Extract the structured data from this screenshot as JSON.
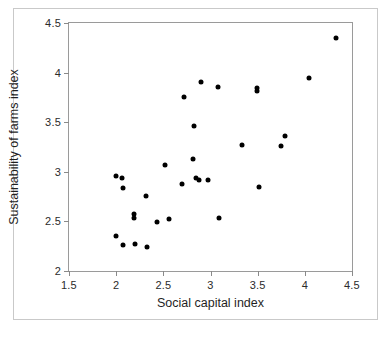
{
  "chart_data": {
    "type": "scatter",
    "title": "",
    "xlabel": "Social capital index",
    "ylabel": "Sustainability of farms index",
    "xlim": [
      1.5,
      4.5
    ],
    "ylim": [
      2,
      4.5
    ],
    "xticks": [
      "1.5",
      "2",
      "2.5",
      "3",
      "3.5",
      "4",
      "4.5"
    ],
    "xtick_values": [
      1.5,
      2,
      2.5,
      3,
      3.5,
      4,
      4.5
    ],
    "yticks": [
      "2",
      "2.5",
      "3",
      "3.5",
      "4",
      "4.5"
    ],
    "ytick_values": [
      2,
      2.5,
      3,
      3.5,
      4,
      4.5
    ],
    "grid": false,
    "legend": null,
    "marker": {
      "shape": "diamond-dot",
      "color": "#000000",
      "size": 5
    },
    "points": [
      {
        "x": 2.0,
        "y": 2.96
      },
      {
        "x": 2.0,
        "y": 2.35
      },
      {
        "x": 2.06,
        "y": 2.94
      },
      {
        "x": 2.07,
        "y": 2.84
      },
      {
        "x": 2.07,
        "y": 2.26
      },
      {
        "x": 2.19,
        "y": 2.57
      },
      {
        "x": 2.19,
        "y": 2.53
      },
      {
        "x": 2.2,
        "y": 2.27
      },
      {
        "x": 2.32,
        "y": 2.76
      },
      {
        "x": 2.33,
        "y": 2.24
      },
      {
        "x": 2.43,
        "y": 2.49
      },
      {
        "x": 2.52,
        "y": 3.07
      },
      {
        "x": 2.56,
        "y": 2.52
      },
      {
        "x": 2.7,
        "y": 2.88
      },
      {
        "x": 2.72,
        "y": 3.75
      },
      {
        "x": 2.81,
        "y": 3.13
      },
      {
        "x": 2.83,
        "y": 3.46
      },
      {
        "x": 2.85,
        "y": 2.94
      },
      {
        "x": 2.88,
        "y": 2.92
      },
      {
        "x": 2.9,
        "y": 3.91
      },
      {
        "x": 2.97,
        "y": 2.92
      },
      {
        "x": 3.08,
        "y": 3.85
      },
      {
        "x": 3.09,
        "y": 2.53
      },
      {
        "x": 3.33,
        "y": 3.27
      },
      {
        "x": 3.49,
        "y": 3.84
      },
      {
        "x": 3.49,
        "y": 3.81
      },
      {
        "x": 3.51,
        "y": 2.85
      },
      {
        "x": 3.75,
        "y": 3.26
      },
      {
        "x": 3.79,
        "y": 3.36
      },
      {
        "x": 4.04,
        "y": 3.95
      },
      {
        "x": 4.33,
        "y": 4.35
      }
    ]
  }
}
